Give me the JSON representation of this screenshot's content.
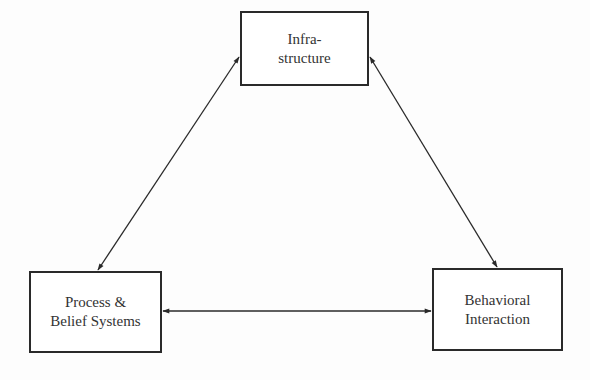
{
  "diagram": {
    "type": "triangular relationship diagram",
    "nodes": [
      {
        "id": "infrastructure",
        "lines": [
          "Infra-",
          "structure"
        ]
      },
      {
        "id": "process_belief",
        "lines": [
          "Process &",
          "Belief Systems"
        ]
      },
      {
        "id": "behavioral",
        "lines": [
          "Behavioral",
          "Interaction"
        ]
      }
    ],
    "edges": [
      {
        "from": "infrastructure",
        "to": "process_belief",
        "direction": "bidirectional"
      },
      {
        "from": "infrastructure",
        "to": "behavioral",
        "direction": "bidirectional"
      },
      {
        "from": "process_belief",
        "to": "behavioral",
        "direction": "bidirectional"
      }
    ],
    "colors": {
      "line": "#2a2a2a",
      "text": "#333333",
      "background": "#fdfdfd"
    }
  }
}
